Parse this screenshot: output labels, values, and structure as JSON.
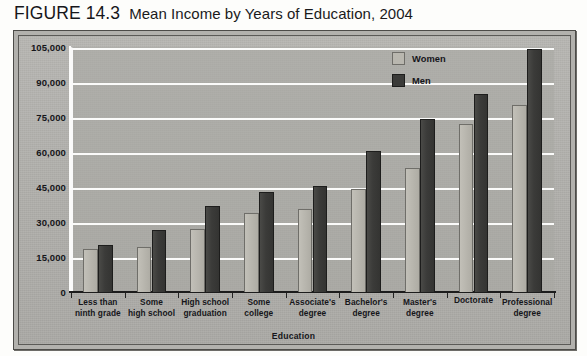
{
  "figure": {
    "label": "FIGURE 14.3",
    "title": "Mean Income by Years of Education, 2004"
  },
  "legend": {
    "position": "top-right-inside",
    "items": [
      {
        "label": "Women",
        "color": "#b9b7af",
        "swatch": "women-swatch"
      },
      {
        "label": "Men",
        "color": "#3b3b39",
        "swatch": "men-swatch"
      }
    ]
  },
  "axes": {
    "ylabel": "Mean Income",
    "xlabel": "Education",
    "yticks": [
      "105,000",
      "90,000",
      "75,000",
      "60,000",
      "45,000",
      "30,000",
      "15,000",
      "0"
    ]
  },
  "chart_data": {
    "type": "bar",
    "title": "Mean Income by Years of Education, 2004",
    "xlabel": "Education",
    "ylabel": "Mean Income",
    "ylim": [
      0,
      105000
    ],
    "ytick_step": 15000,
    "grid": true,
    "legend_position": "upper right inside plot",
    "categories": [
      "Less than ninth grade",
      "Some high school",
      "High school graduation",
      "Some college",
      "Associate's degree",
      "Bachelor's degree",
      "Master's degree",
      "Doctorate",
      "Professional degree"
    ],
    "category_lines": [
      [
        "Less than",
        "ninth grade"
      ],
      [
        "Some",
        "high school"
      ],
      [
        "High school",
        "graduation"
      ],
      [
        "Some",
        "college"
      ],
      [
        "Associate's",
        "degree"
      ],
      [
        "Bachelor's",
        "degree"
      ],
      [
        "Master's",
        "degree"
      ],
      [
        "Doctorate"
      ],
      [
        "Professional",
        "degree"
      ]
    ],
    "series": [
      {
        "name": "Women",
        "color": "#b9b7af",
        "values": [
          18500,
          19500,
          27000,
          34000,
          35500,
          44000,
          53000,
          72000,
          80000
        ]
      },
      {
        "name": "Men",
        "color": "#3b3b39",
        "values": [
          20000,
          26500,
          37000,
          43000,
          45500,
          60500,
          74000,
          85000,
          104000
        ]
      }
    ]
  }
}
